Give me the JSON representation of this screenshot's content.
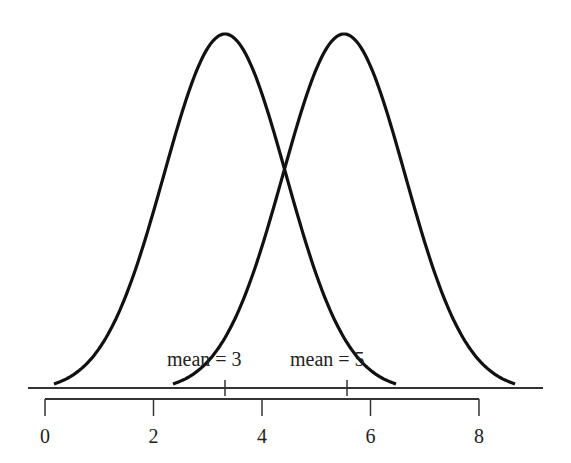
{
  "chart_data": {
    "type": "line",
    "title": "",
    "series": [
      {
        "name": "mean = 3",
        "mean": 3,
        "sd": 1
      },
      {
        "name": "mean = 5",
        "mean": 5,
        "sd": 1
      }
    ],
    "annotations": [
      "mean = 3",
      "mean = 5"
    ],
    "xticks": [
      "0",
      "2",
      "4",
      "6",
      "8"
    ],
    "xlim": [
      0,
      8
    ],
    "xlabel": "",
    "ylabel": "",
    "grid": false
  },
  "labels": {
    "mean1": "mean = 3",
    "mean2": "mean = 5"
  },
  "axis": {
    "ticks": [
      "0",
      "2",
      "4",
      "6",
      "8"
    ]
  },
  "colors": {
    "curve": "#111111",
    "axis": "#333333"
  }
}
